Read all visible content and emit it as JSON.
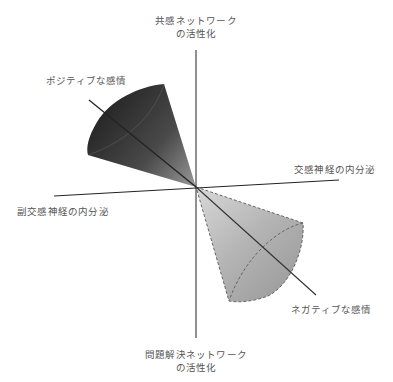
{
  "diagram": {
    "type": "emotion-axes-cones",
    "labels": {
      "top_line1": "共感ネットワーク",
      "top_line2": "の活性化",
      "bottom_line1": "問題解決ネットワーク",
      "bottom_line2": "の活性化",
      "right": "交感神経の内分泌",
      "left": "副交感神経の内分泌",
      "positive": "ポジティブな感情",
      "negative": "ネガティブな感情"
    },
    "colors": {
      "axis": "#222222",
      "positive_cone_dark": "#2a2a2a",
      "positive_cone_light": "#8a8a8a",
      "negative_cone_dark": "#b0b0b0",
      "negative_cone_light": "#dcdcdc",
      "negative_cone_outline": "#666666",
      "text": "#555555"
    }
  }
}
